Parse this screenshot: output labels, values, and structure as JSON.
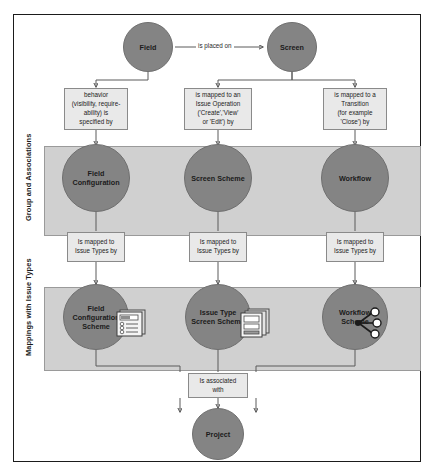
{
  "diagram": {
    "colors": {
      "node_fill": "#848484",
      "band_fill": "#d0d0d0",
      "box_fill": "#e9e9e9",
      "frame_border": "#1b1b1b",
      "connector": "#5a5a5a"
    },
    "bands": [
      {
        "id": "group",
        "label": "Group and Associations"
      },
      {
        "id": "mappings",
        "label": "Mappings with Issue Types"
      }
    ],
    "top_nodes": [
      {
        "id": "field",
        "label": "Field"
      },
      {
        "id": "screen",
        "label": "Screen"
      }
    ],
    "edge_labels": [
      {
        "id": "is-placed-on",
        "label": "is placed on"
      }
    ],
    "relation_boxes_upper": [
      {
        "id": "behavior",
        "label": "behavior\n(visibility, require-\nability) is\nspecified by"
      },
      {
        "id": "issue-operation",
        "label": "is mapped to an\nIssue Operation\n('Create','View'\nor 'Edit') by"
      },
      {
        "id": "transition",
        "label": "is mapped to a\nTransition\n(for example\n'Close') by"
      }
    ],
    "group_nodes": [
      {
        "id": "field-configuration",
        "label": "Field Configuration"
      },
      {
        "id": "screen-scheme",
        "label": "Screen Scheme"
      },
      {
        "id": "workflow",
        "label": "Workflow"
      }
    ],
    "relation_boxes_lower": [
      {
        "id": "issue-types-1",
        "label": "Is mapped to\nIssue Types by"
      },
      {
        "id": "issue-types-2",
        "label": "Is mapped to\nIssue Types by"
      },
      {
        "id": "issue-types-3",
        "label": "Is mapped to\nIssue Types by"
      }
    ],
    "mapping_nodes": [
      {
        "id": "field-configuration-scheme",
        "label": "Field Configuration\nScheme",
        "icon": "form-document-icon"
      },
      {
        "id": "issue-type-screen-scheme",
        "label": "Issue Type Screen\nScheme",
        "icon": "stacked-window-icon"
      },
      {
        "id": "workflow-scheme",
        "label": "Workflow Scheme",
        "icon": "workflow-graph-icon"
      }
    ],
    "association_box": {
      "id": "is-associated-with",
      "label": "Is associated\nwith"
    },
    "bottom_node": {
      "id": "project",
      "label": "Project"
    }
  }
}
